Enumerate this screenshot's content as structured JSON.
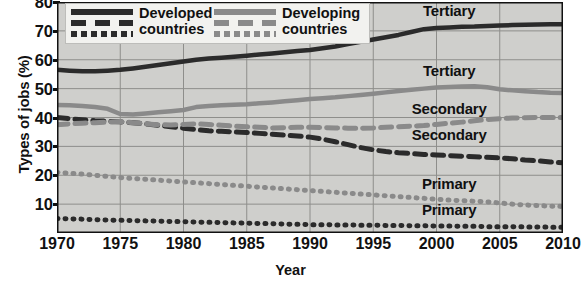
{
  "chart_data": {
    "type": "line",
    "title": "",
    "xlabel": "Year",
    "ylabel": "Types of jobs (%)",
    "xlim": [
      1970,
      2010
    ],
    "ylim": [
      0,
      80
    ],
    "xticks": [
      1970,
      1975,
      1980,
      1985,
      1990,
      1995,
      2000,
      2005,
      2010
    ],
    "yticks": [
      10,
      20,
      30,
      40,
      50,
      60,
      70,
      80
    ],
    "grid": true,
    "legend_position": "top-left",
    "x": [
      1970,
      1971,
      1972,
      1973,
      1974,
      1975,
      1976,
      1977,
      1978,
      1979,
      1980,
      1981,
      1982,
      1983,
      1984,
      1985,
      1986,
      1987,
      1988,
      1989,
      1990,
      1991,
      1992,
      1993,
      1994,
      1995,
      1996,
      1997,
      1998,
      1999,
      2000,
      2001,
      2002,
      2003,
      2004,
      2005,
      2006,
      2007,
      2008,
      2009,
      2010
    ],
    "series": [
      {
        "name": "Developed countries - Tertiary",
        "group": "Developed countries",
        "sector": "Tertiary",
        "style": "solid",
        "color": "#2b2b2b",
        "values": [
          56.5,
          56.2,
          56.0,
          56.0,
          56.2,
          56.5,
          57.0,
          57.6,
          58.2,
          58.8,
          59.4,
          60.0,
          60.4,
          60.7,
          61.0,
          61.4,
          61.8,
          62.2,
          62.6,
          63.0,
          63.4,
          64.0,
          64.6,
          65.4,
          66.2,
          67.0,
          67.8,
          68.6,
          69.6,
          70.6,
          71.0,
          71.2,
          71.4,
          71.5,
          71.7,
          71.9,
          72.0,
          72.1,
          72.2,
          72.3,
          72.3
        ]
      },
      {
        "name": "Developing countries - Tertiary",
        "group": "Developing countries",
        "sector": "Tertiary",
        "style": "solid",
        "color": "#8a8a8a",
        "values": [
          44.3,
          44.2,
          44.0,
          43.6,
          43.0,
          41.2,
          41.0,
          41.4,
          41.8,
          42.2,
          42.6,
          43.6,
          44.0,
          44.2,
          44.4,
          44.6,
          44.9,
          45.2,
          45.6,
          46.0,
          46.4,
          46.7,
          47.0,
          47.4,
          47.8,
          48.2,
          48.7,
          49.2,
          49.6,
          50.0,
          50.4,
          50.6,
          50.7,
          50.8,
          50.5,
          49.8,
          49.4,
          49.1,
          48.8,
          48.6,
          48.5
        ]
      },
      {
        "name": "Developed countries - Secondary",
        "group": "Developed countries",
        "sector": "Secondary",
        "style": "dashed",
        "color": "#2b2b2b",
        "values": [
          40.0,
          39.6,
          39.2,
          38.9,
          38.7,
          38.5,
          38.2,
          37.8,
          37.3,
          36.8,
          36.3,
          35.8,
          35.4,
          35.2,
          35.0,
          34.8,
          34.5,
          34.2,
          33.9,
          33.6,
          33.2,
          32.5,
          31.6,
          30.6,
          29.6,
          28.8,
          28.2,
          27.8,
          27.5,
          27.2,
          27.0,
          26.8,
          26.6,
          26.4,
          26.2,
          26.0,
          25.7,
          25.3,
          25.0,
          24.6,
          24.3
        ]
      },
      {
        "name": "Developing countries - Secondary",
        "group": "Developing countries",
        "sector": "Secondary",
        "style": "dashed",
        "color": "#8a8a8a",
        "values": [
          37.5,
          37.8,
          38.0,
          38.2,
          38.4,
          38.6,
          38.2,
          37.8,
          37.5,
          37.4,
          37.6,
          37.8,
          37.6,
          37.3,
          37.0,
          36.8,
          36.6,
          36.4,
          36.5,
          36.6,
          36.6,
          36.5,
          36.4,
          36.3,
          36.3,
          36.4,
          36.6,
          36.8,
          37.0,
          37.2,
          37.6,
          38.0,
          38.4,
          38.9,
          39.3,
          39.6,
          39.8,
          39.9,
          40.0,
          40.0,
          40.0
        ]
      },
      {
        "name": "Developing countries - Primary",
        "group": "Developing countries",
        "sector": "Primary",
        "style": "dotted",
        "color": "#8a8a8a",
        "values": [
          21.0,
          20.7,
          20.4,
          20.0,
          19.6,
          19.2,
          18.9,
          18.6,
          18.3,
          18.0,
          17.7,
          17.4,
          17.1,
          16.8,
          16.5,
          16.2,
          15.9,
          15.6,
          15.3,
          15.0,
          14.7,
          14.4,
          14.1,
          13.8,
          13.5,
          13.2,
          12.9,
          12.6,
          12.3,
          12.0,
          11.7,
          11.4,
          11.2,
          11.0,
          10.8,
          10.4,
          10.0,
          9.7,
          9.5,
          9.3,
          9.2
        ]
      },
      {
        "name": "Developed countries - Primary",
        "group": "Developed countries",
        "sector": "Primary",
        "style": "dotted",
        "color": "#2b2b2b",
        "values": [
          5.0,
          4.9,
          4.8,
          4.6,
          4.5,
          4.4,
          4.3,
          4.2,
          4.1,
          4.0,
          3.9,
          3.8,
          3.7,
          3.6,
          3.5,
          3.4,
          3.3,
          3.2,
          3.1,
          3.0,
          2.9,
          2.9,
          2.8,
          2.8,
          2.7,
          2.7,
          2.6,
          2.6,
          2.5,
          2.5,
          2.4,
          2.4,
          2.3,
          2.3,
          2.2,
          2.2,
          2.2,
          2.1,
          2.1,
          2.0,
          2.0
        ]
      }
    ],
    "annotations": [
      {
        "text": "Tertiary",
        "x": 2001,
        "y": 77,
        "for": "Developed countries - Tertiary"
      },
      {
        "text": "Tertiary",
        "x": 2001,
        "y": 56,
        "for": "Developing countries - Tertiary"
      },
      {
        "text": "Secondary",
        "x": 2001,
        "y": 43,
        "for": "Developing countries - Secondary"
      },
      {
        "text": "Secondary",
        "x": 2001,
        "y": 34,
        "for": "Developed countries - Secondary"
      },
      {
        "text": "Primary",
        "x": 2001,
        "y": 17,
        "for": "Developing countries - Primary"
      },
      {
        "text": "Primary",
        "x": 2001,
        "y": 8,
        "for": "Developed countries - Primary"
      }
    ]
  },
  "legend": {
    "entries": [
      {
        "label_line1": "Developed",
        "label_line2": "countries",
        "color": "#2b2b2b"
      },
      {
        "label_line1": "Developing",
        "label_line2": "countries",
        "color": "#8a8a8a"
      }
    ]
  },
  "axis": {
    "ylabel": "Types of jobs (%)",
    "xlabel": "Year",
    "ytick_labels": [
      "80",
      "70",
      "60",
      "50",
      "40",
      "30",
      "20",
      "10"
    ],
    "xtick_labels": [
      "1970",
      "1975",
      "1980",
      "1985",
      "1990",
      "1995",
      "2000",
      "2005",
      "2010"
    ]
  },
  "colors": {
    "plot_background": "#cfcfcc",
    "grid": "#8e8e8b",
    "axis": "#111111",
    "developed": "#2b2b2b",
    "developing": "#8a8a8a",
    "legend_background": "#f2f2ef"
  },
  "labels": {
    "tertiary": "Tertiary",
    "secondary": "Secondary",
    "primary": "Primary"
  }
}
